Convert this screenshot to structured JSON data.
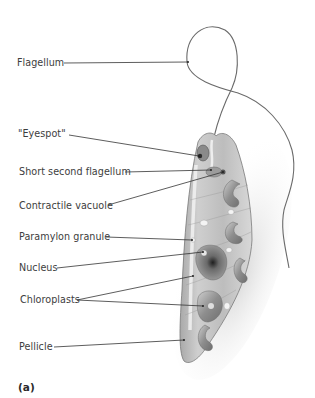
{
  "figure": {
    "panel_label": "(a)",
    "colors": {
      "leader_line": "#333333",
      "cell_fill": "#b9b9b9",
      "cell_edge": "#7a7a7a",
      "flagellum": "#6a6a6a",
      "label_text": "#3d3d3d"
    },
    "labels": [
      {
        "id": "flagellum",
        "text": "Flagellum"
      },
      {
        "id": "eyespot",
        "text": "\"Eyespot\""
      },
      {
        "id": "short-second-flagellum",
        "text": "Short second flagellum"
      },
      {
        "id": "contractile-vacuole",
        "text": "Contractile vacuole"
      },
      {
        "id": "paramylon-granule",
        "text": "Paramylon granule"
      },
      {
        "id": "nucleus",
        "text": "Nucleus"
      },
      {
        "id": "chloroplasts",
        "text": "Chloroplasts"
      },
      {
        "id": "pellicle",
        "text": "Pellicle"
      }
    ]
  }
}
